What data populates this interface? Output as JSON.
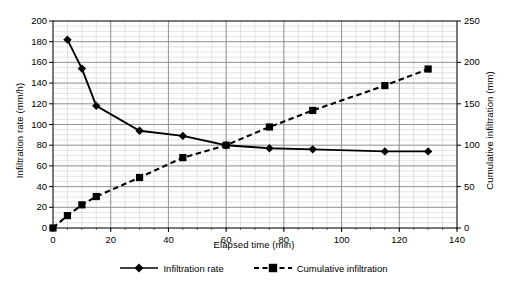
{
  "chart_data": {
    "type": "line",
    "title": "",
    "xlabel": "Elapsed time (min)",
    "ylabel": "Infiltration rate (mm/h)",
    "y2label": "Cumulative infiltration (mm)",
    "xlim": [
      0,
      140
    ],
    "ylim": [
      0,
      200
    ],
    "y2lim": [
      0,
      250
    ],
    "xticks": [
      0,
      20,
      40,
      60,
      80,
      100,
      120,
      140
    ],
    "yticks": [
      0,
      20,
      40,
      60,
      80,
      100,
      120,
      140,
      160,
      180,
      200
    ],
    "y2ticks": [
      0,
      50,
      100,
      150,
      200,
      250
    ],
    "xtick_labels": [
      "0",
      "20",
      "40",
      "60",
      "80",
      "100",
      "120",
      "140"
    ],
    "ytick_labels": [
      "0",
      "20",
      "40",
      "60",
      "80",
      "100",
      "120",
      "140",
      "160",
      "180",
      "200"
    ],
    "y2tick_labels": [
      "0",
      "50",
      "100",
      "150",
      "200",
      "250"
    ],
    "grid": true,
    "minor_grid": true,
    "minor_x_step": 5,
    "minor_y_step": 5,
    "legend_position": "bottom",
    "series": [
      {
        "name": "Infiltration rate",
        "axis": "left",
        "marker": "diamond",
        "linestyle": "solid",
        "color": "#000000",
        "x": [
          5,
          10,
          15,
          30,
          45,
          60,
          75,
          90,
          115,
          130
        ],
        "values": [
          182,
          154,
          118,
          94,
          89,
          80,
          77,
          76,
          74,
          74
        ]
      },
      {
        "name": "Cumulative infiltration",
        "axis": "right",
        "marker": "square",
        "linestyle": "dashed",
        "color": "#000000",
        "x": [
          0,
          5,
          10,
          15,
          30,
          45,
          60,
          75,
          90,
          115,
          130
        ],
        "values": [
          0,
          15,
          28,
          38,
          61,
          85,
          100,
          122,
          142,
          172,
          192
        ]
      }
    ]
  },
  "legend": {
    "entries": [
      {
        "label": "Infiltration rate",
        "marker": "diamond",
        "linestyle": "solid"
      },
      {
        "label": "Cumulative infiltration",
        "marker": "square",
        "linestyle": "dashed"
      }
    ]
  }
}
